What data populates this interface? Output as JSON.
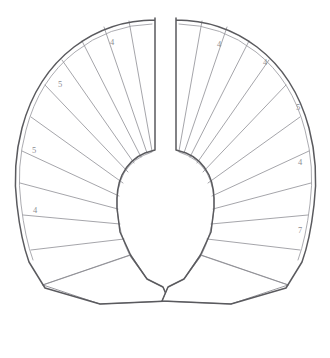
{
  "document": {
    "kind": "pattern-drawing",
    "title": "Flared collar pattern — two mirrored halves",
    "background_color": "#ffffff",
    "ink_color": "#5a5a5e",
    "light_ink_color": "#8a8a90",
    "label_color": "#8d8d93",
    "width": 330,
    "height": 358
  },
  "labels": {
    "left": [
      {
        "id": "left-label-1",
        "text": "4",
        "x": 112,
        "y": 43
      },
      {
        "id": "left-label-2",
        "text": "5",
        "x": 60,
        "y": 85
      },
      {
        "id": "left-label-3",
        "text": "5",
        "x": 34,
        "y": 151
      },
      {
        "id": "left-label-4",
        "text": "4",
        "x": 35,
        "y": 211
      }
    ],
    "right": [
      {
        "id": "right-label-1",
        "text": "4",
        "x": 219,
        "y": 45
      },
      {
        "id": "right-label-2",
        "text": "4",
        "x": 265,
        "y": 63
      },
      {
        "id": "right-label-3",
        "text": "5",
        "x": 298,
        "y": 108
      },
      {
        "id": "right-label-4",
        "text": "4",
        "x": 300,
        "y": 163
      },
      {
        "id": "right-label-5",
        "text": "7",
        "x": 300,
        "y": 231
      }
    ]
  },
  "shapes": {
    "left_half": {
      "name": "left-collar-half",
      "outline": "M 155 18 L 155 20 Q 110 20 74 47 Q 36 76 22 128 Q 12 166 17 205 Q 21 240 29 262 L 45 288 L 100 304 L 169 301 L 163 287 L 147 279 L 131 256 L 120 232 L 117 208 Q 116 188 122 175 Q 130 159 145 153 L 155 150 Z",
      "outer_seam": "M 152 24 Q 109 25 75 52 Q 39 80 26 130 Q 16 167 21 204 Q 25 238 33 260",
      "inner_neck": "M 152 152 Q 133 158 124 173 Q 116 188 117 209 Q 119 234 130 256 L 147 279",
      "ribs": [
        "M 152 151 L 129 21",
        "M 147 153 L 104 27",
        "M 141 157 L 82 41",
        "M 134 163 L 62 60",
        "M 128 172 L 45 85",
        "M 123 183 L 31 117",
        "M 119 196 L 22 151",
        "M 118 209 L 20 183",
        "M 120 224 L 23 215",
        "M 124 239 L 31 250",
        "M 131 255 L 43 285"
      ],
      "lower_panel": "M 43 285 L 100 304 L 169 301 L 163 287 L 147 279 L 131 255 Z"
    },
    "right_half": {
      "name": "right-collar-half",
      "outline": "M 176 18 L 176 20 Q 221 20 257 47 Q 295 76 309 128 Q 319 166 314 205 Q 310 240 302 262 L 286 288 L 231 304 L 162 301 L 168 287 L 184 279 L 200 256 L 211 232 L 214 208 Q 215 188 209 175 Q 201 159 186 153 L 176 150 Z",
      "outer_seam": "M 179 24 Q 222 25 256 52 Q 292 80 305 130 Q 315 167 310 204 Q 306 238 298 260",
      "inner_neck": "M 179 152 Q 198 158 207 173 Q 215 188 214 209 Q 212 234 201 256 L 184 279",
      "ribs": [
        "M 179 151 L 202 21",
        "M 184 153 L 227 27",
        "M 190 157 L 249 41",
        "M 197 163 L 269 60",
        "M 203 172 L 286 85",
        "M 208 183 L 300 117",
        "M 212 196 L 309 151",
        "M 213 209 L 311 183",
        "M 211 224 L 308 215",
        "M 207 239 L 300 250",
        "M 200 255 L 288 285"
      ],
      "lower_panel": "M 288 285 L 231 304 L 162 301 L 168 287 L 184 279 L 200 255 Z"
    }
  }
}
